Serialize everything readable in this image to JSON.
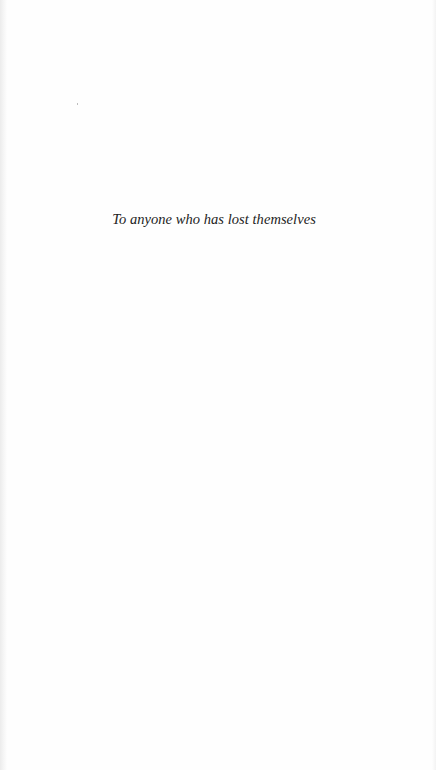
{
  "page": {
    "type": "dedication",
    "background": "#fefefe",
    "text_color": "#222222",
    "dedication_text": "To anyone who has lost themselves"
  }
}
